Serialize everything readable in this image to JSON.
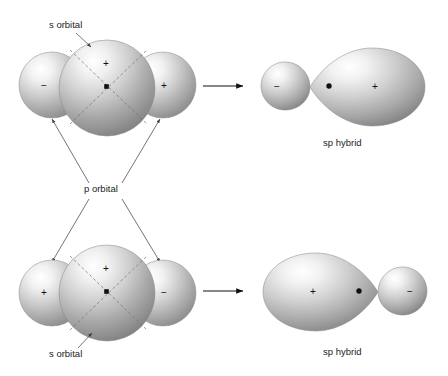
{
  "figure": {
    "background_color": "#ffffff",
    "ink_color": "#1a1a1a"
  },
  "labels": {
    "s_orbital_top": "s orbital",
    "p_orbital": "p orbital",
    "s_orbital_bottom": "s orbital",
    "sp_hybrid_top": "sp hybrid",
    "sp_hybrid_bottom": "sp hybrid"
  },
  "signs": {
    "plus": "+",
    "minus": "−"
  },
  "rows": [
    {
      "id": "row-top",
      "reactant": {
        "name": "s-plus-p-orbital-overlap-top",
        "lobes": [
          {
            "name": "p-orbital-left-lobe",
            "sign": "−",
            "size": "small"
          },
          {
            "name": "s-orbital-sphere",
            "sign": "+",
            "size": "large"
          },
          {
            "name": "p-orbital-right-lobe",
            "sign": "+",
            "size": "small"
          }
        ]
      },
      "arrow": "→",
      "product": {
        "name": "sp-hybrid-orbital-top",
        "label": "sp hybrid",
        "lobes": [
          {
            "name": "sp-hybrid-small-lobe",
            "sign": "−",
            "size": "small",
            "position": "left"
          },
          {
            "name": "sp-hybrid-large-lobe",
            "sign": "+",
            "size": "large",
            "position": "right"
          }
        ]
      }
    },
    {
      "id": "row-bottom",
      "reactant": {
        "name": "s-plus-p-orbital-overlap-bottom",
        "lobes": [
          {
            "name": "p-orbital-left-lobe",
            "sign": "+",
            "size": "small"
          },
          {
            "name": "s-orbital-sphere",
            "sign": "+",
            "size": "large"
          },
          {
            "name": "p-orbital-right-lobe",
            "sign": "−",
            "size": "small"
          }
        ]
      },
      "arrow": "→",
      "product": {
        "name": "sp-hybrid-orbital-bottom",
        "label": "sp hybrid",
        "lobes": [
          {
            "name": "sp-hybrid-large-lobe",
            "sign": "+",
            "size": "large",
            "position": "left"
          },
          {
            "name": "sp-hybrid-small-lobe",
            "sign": "−",
            "size": "small",
            "position": "right"
          }
        ]
      }
    }
  ]
}
